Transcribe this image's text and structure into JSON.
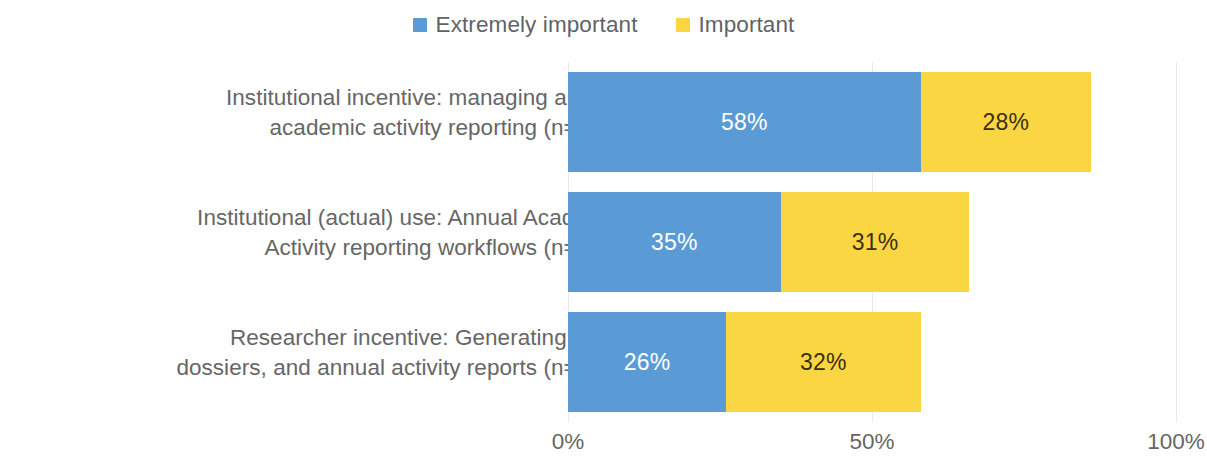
{
  "chart_data": {
    "type": "bar",
    "orientation": "horizontal",
    "stacked": true,
    "title": "",
    "subtitle": "",
    "xlabel": "",
    "ylabel": "",
    "xlim": [
      0,
      100
    ],
    "xticks": [
      "0%",
      "50%",
      "100%"
    ],
    "xtick_values": [
      0,
      50,
      100
    ],
    "grid": true,
    "grid_axis": "x",
    "legend_position": "top-center",
    "categories": [
      "Institutional incentive: managing annual academic activity reporting (n=222)",
      "Institutional (actual) use: Annual Academic Activity reporting workflows (n=203)",
      "Researcher incentive: Generating CVs, dossiers, and annual activity reports (n=154)"
    ],
    "category_lines": [
      [
        "Institutional incentive: managing annual",
        "academic activity reporting (n=222)"
      ],
      [
        "Institutional (actual) use: Annual Academic",
        "Activity reporting workflows (n=203)"
      ],
      [
        "Researcher incentive: Generating CVs,",
        "dossiers, and annual activity reports (n=154)"
      ]
    ],
    "series": [
      {
        "name": "Extremely important",
        "color": "#5B9BD5",
        "values": [
          58,
          35,
          26
        ],
        "labels": [
          "58%",
          "35%",
          "26%"
        ],
        "label_color": "#FFFFFF"
      },
      {
        "name": "Important",
        "color": "#FAD643",
        "values": [
          28,
          31,
          32
        ],
        "labels": [
          "28%",
          "31%",
          "32%"
        ],
        "label_color": "#3B2F10"
      }
    ]
  },
  "legend": {
    "items": [
      {
        "label": "Extremely important",
        "color": "#5B9BD5"
      },
      {
        "label": "Important",
        "color": "#FAD643"
      }
    ]
  },
  "axis": {
    "ticks": [
      {
        "label": "0%",
        "value": 0
      },
      {
        "label": "50%",
        "value": 50
      },
      {
        "label": "100%",
        "value": 100
      }
    ]
  },
  "colors": {
    "extremely_important": "#5B9BD5",
    "important": "#FAD643",
    "text": "#666666",
    "gridline": "#E8E8E8",
    "background": "#FFFFFF"
  }
}
